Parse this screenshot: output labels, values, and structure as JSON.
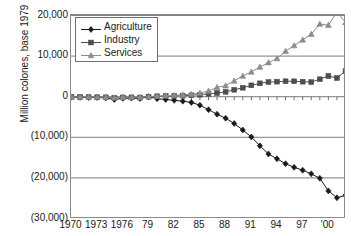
{
  "chart_data": {
    "type": "line",
    "title": "",
    "xlabel": "",
    "ylabel": "Million colones, base 1979",
    "ylim": [
      -30000,
      20000
    ],
    "xlim": [
      1970,
      2002
    ],
    "grid": true,
    "legend_position": "top-left",
    "y_ticks": [
      20000,
      10000,
      0,
      -10000,
      -20000,
      -30000
    ],
    "y_tick_labels": [
      "20,000",
      "10,000",
      "0",
      "(10,000)",
      "(20,000)",
      "(30,000)"
    ],
    "x_ticks": [
      1970,
      1973,
      1976,
      1979,
      1982,
      1985,
      1988,
      1991,
      1994,
      1997,
      2000
    ],
    "x_tick_labels": [
      "1970",
      "1973",
      "1976",
      "79",
      "82",
      "85",
      "88",
      "91",
      "94",
      "97",
      "'00"
    ],
    "x": [
      1970,
      1971,
      1972,
      1973,
      1974,
      1975,
      1976,
      1977,
      1978,
      1979,
      1980,
      1981,
      1982,
      1983,
      1984,
      1985,
      1986,
      1987,
      1988,
      1989,
      1990,
      1991,
      1992,
      1993,
      1994,
      1995,
      1996,
      1997,
      1998,
      1999,
      2000,
      2001,
      2002
    ],
    "series": [
      {
        "name": "Agriculture",
        "marker": "diamond",
        "color": "#1a1a1a",
        "values": [
          -100,
          -150,
          -180,
          -220,
          -300,
          -700,
          -400,
          -350,
          -450,
          0,
          -500,
          -700,
          -900,
          -1100,
          -1400,
          -2100,
          -3200,
          -4300,
          -5300,
          -6600,
          -8200,
          -9900,
          -12100,
          -14100,
          -15300,
          -16500,
          -17400,
          -18100,
          -19000,
          -20100,
          -23200,
          -24900,
          -24300
        ]
      },
      {
        "name": "Industry",
        "marker": "square",
        "color": "#4d4d4d",
        "values": [
          -60,
          -80,
          -100,
          -120,
          -150,
          -300,
          -180,
          -160,
          -200,
          0,
          100,
          150,
          200,
          250,
          350,
          500,
          700,
          900,
          1200,
          1700,
          2200,
          2800,
          3300,
          3600,
          3700,
          3800,
          3800,
          3700,
          3600,
          4300,
          5100,
          4600,
          6300
        ]
      },
      {
        "name": "Services",
        "marker": "triangle",
        "color": "#8c8c8c",
        "values": [
          -50,
          -60,
          -70,
          -90,
          -110,
          -250,
          -130,
          -120,
          -150,
          0,
          150,
          250,
          350,
          450,
          600,
          900,
          1400,
          2300,
          2700,
          3900,
          5100,
          6100,
          7300,
          8400,
          9400,
          11200,
          12600,
          14000,
          15400,
          17900,
          17600,
          20900,
          18300
        ]
      }
    ]
  },
  "legend": {
    "items": [
      {
        "label": "Agriculture"
      },
      {
        "label": "Industry"
      },
      {
        "label": "Services"
      }
    ]
  }
}
